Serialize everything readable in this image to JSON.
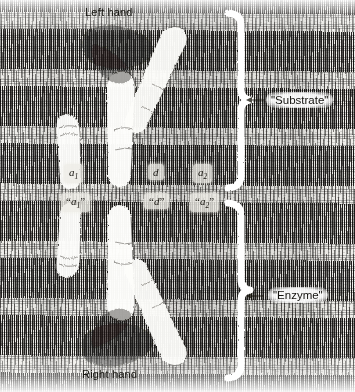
{
  "figure": {
    "title_alt": "Mirror-image hands illustrating enzyme-substrate stereospecificity",
    "captions": {
      "top": "Left hand",
      "bottom": "Right hand"
    },
    "brace_labels": {
      "upper": "\"Substrate\"",
      "lower": "\"Enzyme\""
    },
    "markers": {
      "upper_row": [
        {
          "id": "a1",
          "base": "a",
          "sub": "1",
          "quoted": false
        },
        {
          "id": "d",
          "base": "d",
          "sub": "",
          "quoted": false
        },
        {
          "id": "a2",
          "base": "a",
          "sub": "2",
          "quoted": false
        }
      ],
      "lower_row": [
        {
          "id": "a1q",
          "base": "a",
          "sub": "1",
          "quoted": true
        },
        {
          "id": "dq",
          "base": "d",
          "sub": "",
          "quoted": true
        },
        {
          "id": "a2q",
          "base": "a",
          "sub": "2",
          "quoted": true
        }
      ]
    },
    "marker_text": {
      "a1_base": "a",
      "a1_sub": "1",
      "d_base": "d",
      "d_sub": "",
      "a2_base": "a",
      "a2_sub": "2",
      "quote_open": "“",
      "quote_close": "”"
    },
    "colors": {
      "paper": "#efeeea",
      "ink": "#15140f",
      "highlight": "#ffffff",
      "label_patch": "#eeece6"
    },
    "elements": {
      "upper_brace_name": "substrate-brace",
      "lower_brace_name": "enzyme-brace",
      "mirror_line_name": "mirror-axis"
    }
  }
}
